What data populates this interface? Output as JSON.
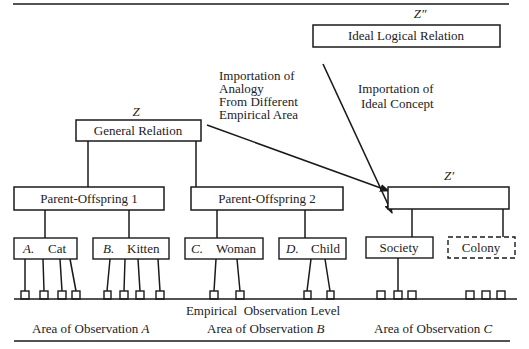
{
  "diagram": {
    "type": "hierarchical-concept-diagram",
    "colors": {
      "ink": "#1a1a1a",
      "background": "#ffffff"
    },
    "top_level": {
      "label_symbol": "Z″",
      "box_text": "Ideal Logical Relation"
    },
    "general": {
      "label_symbol": "Z",
      "box_text": "General Relation"
    },
    "target": {
      "label_symbol": "Z′",
      "box_text": ""
    },
    "annotations": {
      "analogy": [
        "Importation of",
        "Analogy",
        "From Different",
        "Empirical Area"
      ],
      "ideal_concept": [
        "Importation of",
        "Ideal Concept"
      ]
    },
    "mid_level": [
      {
        "text": "Parent-Offspring 1"
      },
      {
        "text": "Parent-Offspring 2"
      }
    ],
    "leaf_boxes": [
      {
        "prefix": "A.",
        "text": "Cat",
        "dashed": false
      },
      {
        "prefix": "B.",
        "text": "Kitten",
        "dashed": false
      },
      {
        "prefix": "C.",
        "text": "Woman",
        "dashed": false
      },
      {
        "prefix": "D.",
        "text": "Child",
        "dashed": false
      },
      {
        "prefix": "",
        "text": "Society",
        "dashed": false
      },
      {
        "prefix": "",
        "text": "Colony",
        "dashed": true
      }
    ],
    "observation_level_label": "Empirical  Observation Level",
    "areas": [
      {
        "prefix": "Area of Observation",
        "letter": "A"
      },
      {
        "prefix": "Area of Observation",
        "letter": "B"
      },
      {
        "prefix": "Area of Observation",
        "letter": "C"
      }
    ]
  }
}
